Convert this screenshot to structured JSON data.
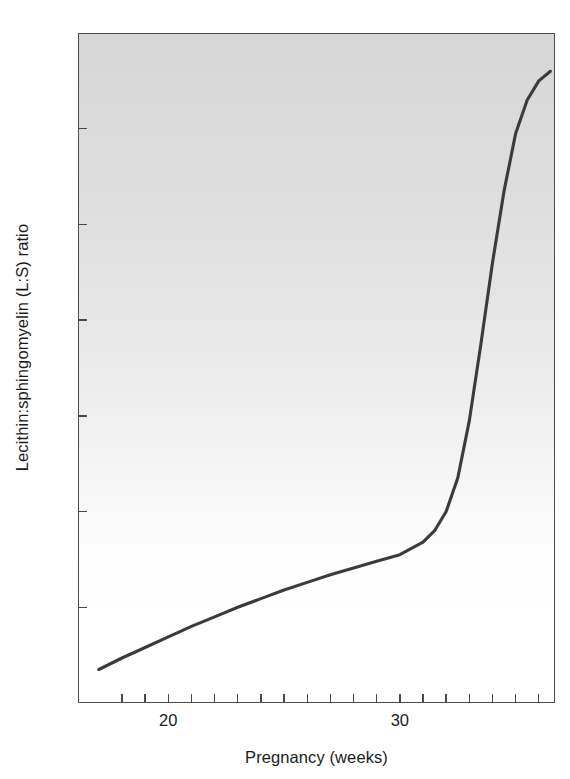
{
  "chart_data": {
    "type": "line",
    "title": "",
    "xlabel": "Pregnancy (weeks)",
    "ylabel": "Lecithin:sphingomyelin (L:S) ratio",
    "xlim": [
      16.1,
      36.7
    ],
    "ylim": [
      0,
      7
    ],
    "grid": false,
    "legend": null,
    "x_tick_labels": [
      "20",
      "30"
    ],
    "x_tick_values": [
      20,
      30
    ],
    "x_minor_tick_values": [
      18,
      19,
      21,
      22,
      23,
      24,
      25,
      26,
      27,
      28,
      29,
      31,
      32,
      33,
      34,
      35,
      36
    ],
    "y_tick_labels": [
      "1",
      "2",
      "3",
      "4",
      "5",
      "6",
      "7"
    ],
    "y_tick_values": [
      1,
      2,
      3,
      4,
      5,
      6,
      7
    ],
    "series": [
      {
        "name": "L:S ratio",
        "x": [
          17.0,
          18.0,
          19.0,
          20.0,
          21.0,
          22.0,
          23.0,
          24.0,
          25.0,
          26.0,
          27.0,
          28.0,
          29.0,
          30.0,
          31.0,
          31.5,
          32.0,
          32.5,
          33.0,
          33.5,
          34.0,
          34.5,
          35.0,
          35.5,
          36.0,
          36.5
        ],
        "y": [
          0.35,
          0.47,
          0.58,
          0.69,
          0.8,
          0.9,
          1.0,
          1.09,
          1.18,
          1.26,
          1.34,
          1.41,
          1.48,
          1.55,
          1.68,
          1.8,
          2.0,
          2.35,
          2.95,
          3.75,
          4.6,
          5.35,
          5.95,
          6.3,
          6.5,
          6.6
        ]
      }
    ]
  },
  "axes": {
    "y_label": "Lecithin:sphingomyelin (L:S) ratio",
    "x_label": "Pregnancy (weeks)"
  },
  "colors": {
    "curve": "#3b3b3b",
    "axis": "#4a4a4a",
    "text": "#1b1b1b",
    "plot_bg_top": "#d6d6d6",
    "plot_bg_bottom": "#ffffff",
    "page_bg": "#ffffff"
  }
}
